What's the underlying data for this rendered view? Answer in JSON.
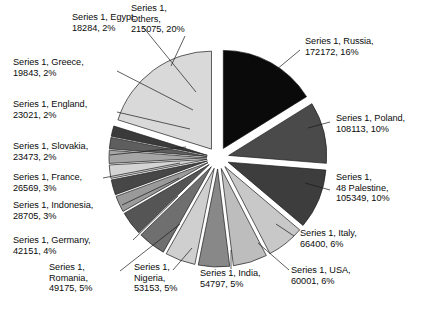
{
  "chart_data": {
    "type": "pie",
    "title": "",
    "series_name": "Series 1",
    "exploded": true,
    "legend": "none",
    "grid": false,
    "total": 1058180,
    "categories": [
      "Russia",
      "Poland",
      "48 Palestine",
      "Italy",
      "USA",
      "India",
      "Nigeria",
      "Romania",
      "Germany",
      "Indonesia",
      "France",
      "Slovakia",
      "England",
      "Greece",
      "Egypt",
      "Others"
    ],
    "values": [
      172172,
      108113,
      105349,
      66400,
      60001,
      54797,
      53153,
      49175,
      42151,
      28705,
      26569,
      23473,
      23021,
      19843,
      18284,
      215075
    ],
    "percentages": [
      "16%",
      "10%",
      "10%",
      "6%",
      "6%",
      "5%",
      "5%",
      "5%",
      "4%",
      "3%",
      "3%",
      "2%",
      "2%",
      "2%",
      "2%",
      "20%"
    ],
    "colors": [
      "#0a0a0a",
      "#4a4a4a",
      "#3d3d3d",
      "#c8c8c8",
      "#bdbdbd",
      "#888888",
      "#cfcfcf",
      "#6f6f6f",
      "#555555",
      "#9a9a9a",
      "#474747",
      "#d4d4d4",
      "#a5a5a5",
      "#5e5e5e",
      "#3a3a3a",
      "#d9d9d9"
    ],
    "slices": [
      {
        "label": "Series 1, Russia,\n172172, 16%",
        "name": "Russia",
        "value": 172172,
        "percent": "16%",
        "color": "#0a0a0a"
      },
      {
        "label": "Series 1, Poland,\n108113, 10%",
        "name": "Poland",
        "value": 108113,
        "percent": "10%",
        "color": "#4a4a4a"
      },
      {
        "label": "Series 1,\n48 Palestine,\n105349, 10%",
        "name": "48 Palestine",
        "value": 105349,
        "percent": "10%",
        "color": "#3d3d3d"
      },
      {
        "label": "Series 1, Italy,\n66400, 6%",
        "name": "Italy",
        "value": 66400,
        "percent": "6%",
        "color": "#c8c8c8"
      },
      {
        "label": "Series 1, USA,\n60001, 6%",
        "name": "USA",
        "value": 60001,
        "percent": "6%",
        "color": "#bdbdbd"
      },
      {
        "label": "Series 1, India,\n54797, 5%",
        "name": "India",
        "value": 54797,
        "percent": "5%",
        "color": "#888888"
      },
      {
        "label": "Series 1,\nNigeria,\n53153, 5%",
        "name": "Nigeria",
        "value": 53153,
        "percent": "5%",
        "color": "#cfcfcf"
      },
      {
        "label": "Series 1,\nRomania,\n49175, 5%",
        "name": "Romania",
        "value": 49175,
        "percent": "5%",
        "color": "#6f6f6f"
      },
      {
        "label": "Series 1, Germany,\n42151, 4%",
        "name": "Germany",
        "value": 42151,
        "percent": "4%",
        "color": "#555555"
      },
      {
        "label": "Series 1, Indonesia,\n28705, 3%",
        "name": "Indonesia",
        "value": 28705,
        "percent": "3%",
        "color": "#9a9a9a"
      },
      {
        "label": "Series 1, France,\n26569, 3%",
        "name": "France",
        "value": 26569,
        "percent": "3%",
        "color": "#474747"
      },
      {
        "label": "Series 1, Slovakia,\n23473, 2%",
        "name": "Slovakia",
        "value": 23473,
        "percent": "2%",
        "color": "#d4d4d4"
      },
      {
        "label": "Series 1, England,\n23021, 2%",
        "name": "England",
        "value": 23021,
        "percent": "2%",
        "color": "#a5a5a5"
      },
      {
        "label": "Series 1, Greece,\n19843, 2%",
        "name": "Greece",
        "value": 19843,
        "percent": "2%",
        "color": "#5e5e5e"
      },
      {
        "label": "Series 1, Egypt,\n18284, 2%",
        "name": "Egypt",
        "value": 18284,
        "percent": "2%",
        "color": "#3a3a3a"
      },
      {
        "label": "Series 1,\nOthers,\n215075, 20%",
        "name": "Others",
        "value": 215075,
        "percent": "20%",
        "color": "#d9d9d9"
      }
    ]
  },
  "labels": {
    "egypt": "Series 1, Egypt,\n18284, 2%",
    "others": "Series 1,\nOthers,\n215075, 20%",
    "greece": "Series 1, Greece,\n19843, 2%",
    "england": "Series 1, England,\n23021, 2%",
    "slovakia": "Series 1, Slovakia,\n23473, 2%",
    "france": "Series 1, France,\n26569, 3%",
    "indonesia": "Series 1, Indonesia,\n28705, 3%",
    "germany": "Series 1, Germany,\n42151, 4%",
    "romania": "Series 1,\nRomania,\n49175, 5%",
    "nigeria": "Series 1,\nNigeria,\n53153, 5%",
    "india": "Series 1, India,\n54797, 5%",
    "usa": "Series 1, USA,\n60001, 6%",
    "italy": "Series 1, Italy,\n66400, 6%",
    "palestine": "Series 1,\n48 Palestine,\n105349, 10%",
    "poland": "Series 1, Poland,\n108113, 10%",
    "russia": "Series 1, Russia,\n172172, 16%"
  }
}
